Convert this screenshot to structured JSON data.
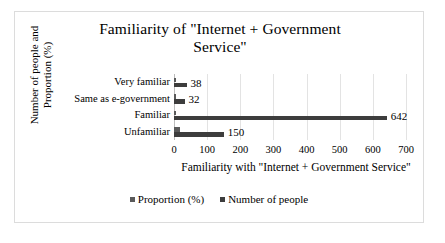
{
  "chart_data": {
    "type": "bar",
    "orientation": "horizontal",
    "title": "Familiarity of \"Internet + Government Service\"",
    "title_line1": "Familiarity of \"Internet + Government",
    "title_line2": "Service\"",
    "xlabel": "Familiarity with \"Internet + Government Service\"",
    "ylabel": "Number of people and Proportion (%)",
    "ylabel_line1": "Number of people and",
    "ylabel_line2": "Proportion (%)",
    "categories": [
      "Very familiar",
      "Same as e-government",
      "Familiar",
      "Unfamiliar"
    ],
    "series": [
      {
        "name": "Proportion (%)",
        "color": "#5a5a5a",
        "values": [
          4,
          4,
          1,
          17
        ],
        "labels": [
          "",
          "",
          "",
          ""
        ]
      },
      {
        "name": "Number of people",
        "color": "#3d3d3d",
        "values": [
          38,
          32,
          642,
          150
        ],
        "labels": [
          "38",
          "32",
          "642",
          "150"
        ]
      }
    ],
    "xlim": [
      0,
      700
    ],
    "xticks": [
      0,
      100,
      200,
      300,
      400,
      500,
      600,
      700
    ],
    "xtick_labels": [
      "0",
      "100",
      "200",
      "300",
      "400",
      "500",
      "600",
      "700"
    ],
    "grid": true,
    "grid_axis": "x",
    "legend_position": "bottom",
    "legend": [
      "Proportion (%)",
      "Number of people"
    ],
    "colors": {
      "proportion": "#5a5a5a",
      "number_of_people": "#3d3d3d",
      "gridline": "#e3e3e3",
      "border": "#dcdcdc",
      "background": "#ffffff",
      "text": "#000000"
    }
  }
}
